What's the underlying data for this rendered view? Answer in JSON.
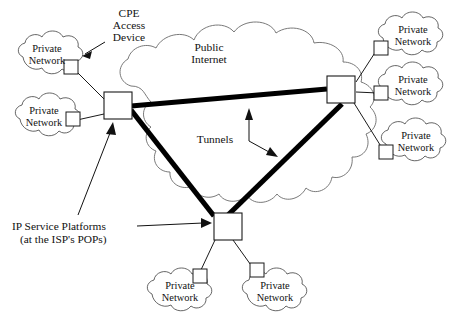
{
  "diagram": {
    "background_color": "#ffffff",
    "ink_color": "#111111",
    "tunnel_color": "#000000",
    "cloud_stroke_color": "#4a4a4a",
    "annotations": {
      "cpe_access_device": "CPE\nAccess\nDevice",
      "cpe_line1": "CPE",
      "cpe_line2": "Access",
      "cpe_line3": "Device",
      "public_internet_line1": "Public",
      "public_internet_line2": "Internet",
      "tunnels": "Tunnels",
      "ip_service_line1": "IP Service Platforms",
      "ip_service_line2": "(at the ISP's POPs)"
    },
    "cloud_label_line1": "Private",
    "cloud_label_line2": "Network",
    "private_networks": [
      {
        "id": "pn-left-top",
        "label_line1": "Private",
        "label_line2": "Network",
        "position": "left-top"
      },
      {
        "id": "pn-left-bottom",
        "label_line1": "Private",
        "label_line2": "Network",
        "position": "left-bottom"
      },
      {
        "id": "pn-right-top",
        "label_line1": "Private",
        "label_line2": "Network",
        "position": "right-top"
      },
      {
        "id": "pn-right-middle",
        "label_line1": "Private",
        "label_line2": "Network",
        "position": "right-middle"
      },
      {
        "id": "pn-right-bottom",
        "label_line1": "Private",
        "label_line2": "Network",
        "position": "right-bottom"
      },
      {
        "id": "pn-bottom-left",
        "label_line1": "Private",
        "label_line2": "Network",
        "position": "bottom-left"
      },
      {
        "id": "pn-bottom-right",
        "label_line1": "Private",
        "label_line2": "Network",
        "position": "bottom-right"
      }
    ],
    "platforms": [
      {
        "id": "platform-left",
        "name": "IP Service Platform (left POP)"
      },
      {
        "id": "platform-right",
        "name": "IP Service Platform (right POP)"
      },
      {
        "id": "platform-bottom",
        "name": "IP Service Platform (bottom POP)"
      }
    ],
    "tunnels": [
      {
        "id": "tunnel-left-right",
        "from": "platform-left",
        "to": "platform-right"
      },
      {
        "id": "tunnel-left-bottom",
        "from": "platform-left",
        "to": "platform-bottom"
      },
      {
        "id": "tunnel-right-bottom",
        "from": "platform-right",
        "to": "platform-bottom"
      }
    ]
  }
}
